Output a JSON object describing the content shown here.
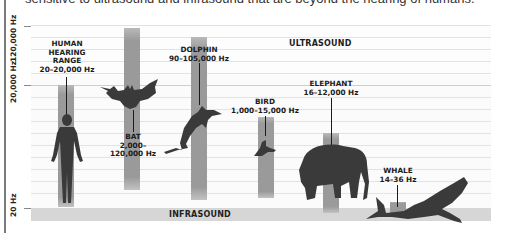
{
  "caption": "sensitive to ultrasound and infrasound that are beyond the hearing of humans.",
  "axis": {
    "ticks": [
      {
        "label": "120,000 Hz"
      },
      {
        "label": "20,000 Hz"
      },
      {
        "label": "20 Hz"
      }
    ]
  },
  "bands": {
    "ultrasound": "ULTRASOUND",
    "infrasound": "INFRASOUND"
  },
  "animals": [
    {
      "name": "HUMAN\nHEARING\nRANGE",
      "name_lines": [
        "HUMAN",
        "HEARING",
        "RANGE"
      ],
      "range": "20–20,000 Hz",
      "icon": "human-silhouette"
    },
    {
      "name_lines": [
        "BAT"
      ],
      "range_lines": [
        "2,000–",
        "120,000 Hz"
      ],
      "icon": "bat-silhouette"
    },
    {
      "name_lines": [
        "DOLPHIN"
      ],
      "range": "90–105,000 Hz",
      "icon": "dolphin-silhouette"
    },
    {
      "name_lines": [
        "BIRD"
      ],
      "range": "1,000–15,000 Hz",
      "icon": "bird-silhouette"
    },
    {
      "name_lines": [
        "ELEPHANT"
      ],
      "range": "16–12,000 Hz",
      "icon": "elephant-silhouette"
    },
    {
      "name_lines": [
        "WHALE"
      ],
      "range": "14–36 Hz",
      "icon": "whale-silhouette"
    }
  ],
  "colors": {
    "bar": "#9a9a9a",
    "silhouette": "#3a3a3a",
    "infrasound_band": "#d6d6d6",
    "grid": "#e3e3e3"
  }
}
